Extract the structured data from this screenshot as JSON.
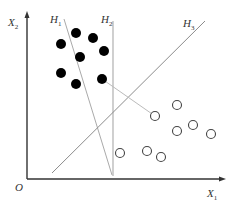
{
  "diagram": {
    "title": "",
    "colors": {
      "axis": "#333333",
      "hyperplane": "#a8a8a8",
      "h3": "#8c8c8c",
      "solid_point": "#000000",
      "hollow_point": "#444444",
      "connector": "#bbbbbb"
    },
    "axes": {
      "origin_label": "O",
      "x_label": "X",
      "x_sub": "1",
      "y_label": "X",
      "y_sub": "2"
    },
    "hyperplanes": [
      {
        "label": "H",
        "sub": "1"
      },
      {
        "label": "H",
        "sub": "2"
      },
      {
        "label": "H",
        "sub": "3"
      }
    ],
    "solid_points": [
      {
        "x": 61,
        "y": 44
      },
      {
        "x": 76,
        "y": 33
      },
      {
        "x": 93,
        "y": 38
      },
      {
        "x": 80,
        "y": 57
      },
      {
        "x": 104,
        "y": 51
      },
      {
        "x": 61,
        "y": 73
      },
      {
        "x": 76,
        "y": 84
      },
      {
        "x": 102,
        "y": 79
      }
    ],
    "hollow_points": [
      {
        "x": 177,
        "y": 105
      },
      {
        "x": 155,
        "y": 116
      },
      {
        "x": 177,
        "y": 131
      },
      {
        "x": 193,
        "y": 125
      },
      {
        "x": 211,
        "y": 134
      },
      {
        "x": 120,
        "y": 153
      },
      {
        "x": 147,
        "y": 151
      },
      {
        "x": 161,
        "y": 157
      }
    ]
  }
}
